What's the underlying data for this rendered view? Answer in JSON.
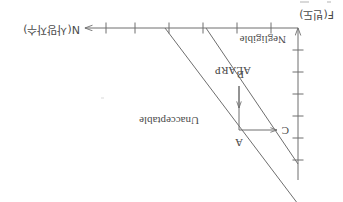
{
  "figure": {
    "type": "f-n-curve",
    "orientation_degrees": 180,
    "stroke_color": "#6e6e6e",
    "text_color": "#4a4a4a",
    "background_color": "#ffffff",
    "axes": {
      "x_axis": {
        "label": "N(사망자수)",
        "direction": "right",
        "tick_count": 6,
        "arrow": "arrow-left-glyph"
      },
      "y_axis": {
        "label": "F(빈도)",
        "direction": "up",
        "tick_count": 6,
        "arrow": "arrow-down-glyph"
      }
    },
    "zones": [
      {
        "id": "unacceptable",
        "label": "Unacceptable"
      },
      {
        "id": "alarp",
        "label": "ALARP"
      },
      {
        "id": "negligible",
        "label": "Negligible"
      }
    ],
    "annotations": [
      {
        "id": "point-a",
        "label": "A",
        "role": "origin-corner"
      },
      {
        "id": "point-b",
        "label": "B",
        "role": "vertical-arrow-head"
      },
      {
        "id": "point-c",
        "label": "C",
        "role": "horizontal-arrow-head"
      }
    ]
  }
}
